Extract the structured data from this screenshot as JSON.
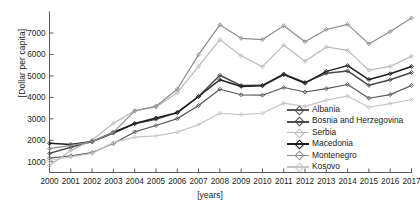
{
  "chart_data": {
    "type": "line",
    "title": "",
    "xlabel": "[years]",
    "ylabel": "[Dollar per capita]",
    "x": [
      2000,
      2001,
      2002,
      2003,
      2004,
      2005,
      2006,
      2007,
      2008,
      2009,
      2010,
      2011,
      2012,
      2013,
      2014,
      2015,
      2016,
      2017
    ],
    "xticklabels": [
      "2000",
      "2001",
      "2002",
      "2003",
      "2004",
      "2005",
      "2006",
      "2007",
      "2008",
      "2009",
      "2010",
      "2011",
      "2012",
      "2013",
      "2014",
      "2015",
      "2016",
      "2017"
    ],
    "yticks": [
      1000,
      2000,
      3000,
      4000,
      5000,
      6000,
      7000
    ],
    "yticklabels": [
      "1000",
      "2000",
      "3000",
      "4000",
      "5000",
      "6000",
      "7000"
    ],
    "ylim": [
      500,
      8000
    ],
    "xlim": [
      2000,
      2017
    ],
    "grid": false,
    "legend_position": "lower-right-inside",
    "marker": "diamond",
    "series": [
      {
        "name": "Albania",
        "color": "#585858",
        "values": [
          1170,
          1280,
          1430,
          1850,
          2390,
          2690,
          3010,
          3620,
          4380,
          4120,
          4100,
          4460,
          4250,
          4410,
          4600,
          3960,
          4130,
          4550
        ]
      },
      {
        "name": "Bosnia and Herzegovina",
        "color": "#4a4a4a",
        "values": [
          1390,
          1680,
          1940,
          2380,
          2770,
          2980,
          3290,
          4040,
          5030,
          4550,
          4560,
          5090,
          4700,
          5120,
          5230,
          4560,
          4820,
          5160
        ]
      },
      {
        "name": "Serbia",
        "color": "#b9b9b9",
        "values": [
          830,
          1530,
          2010,
          2790,
          3380,
          3540,
          4220,
          5440,
          6690,
          5940,
          5430,
          6430,
          5680,
          6350,
          6190,
          5270,
          5440,
          5920
        ]
      },
      {
        "name": "Macedonia",
        "color": "#1e1e1e",
        "values": [
          1860,
          1800,
          1940,
          2340,
          2780,
          3040,
          3290,
          4040,
          4820,
          4510,
          4540,
          5060,
          4660,
          5210,
          5480,
          4830,
          5100,
          5440
        ]
      },
      {
        "name": "Montenegro",
        "color": "#8d8d8d",
        "values": [
          1610,
          1760,
          1940,
          2370,
          3370,
          3590,
          4380,
          5990,
          7380,
          6750,
          6690,
          7340,
          6590,
          7160,
          7400,
          6490,
          7070,
          7700
        ]
      },
      {
        "name": "Kosovo",
        "color": "#c6c6c6",
        "values": [
          1060,
          1230,
          1390,
          1890,
          2150,
          2210,
          2380,
          2730,
          3260,
          3200,
          3260,
          3730,
          3580,
          3870,
          4060,
          3540,
          3710,
          3900
        ]
      }
    ]
  },
  "legend": {
    "items": [
      {
        "label": "Albania"
      },
      {
        "label": "Bosnia and Herzegovina"
      },
      {
        "label": "Serbia"
      },
      {
        "label": "Macedonia"
      },
      {
        "label": "Montenegro"
      },
      {
        "label": "Kosovo"
      }
    ]
  }
}
